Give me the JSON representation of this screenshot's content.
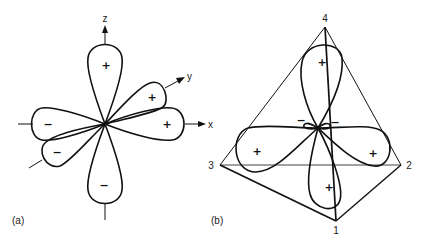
{
  "panel_a": {
    "caption": "(a)",
    "axes": {
      "z": "z",
      "y": "y",
      "x": "x"
    },
    "lobes": [
      {
        "name": "upper-z",
        "sign": "+"
      },
      {
        "name": "lower-z",
        "sign": "−"
      },
      {
        "name": "positive-x",
        "sign": "+"
      },
      {
        "name": "positive-y",
        "sign": "+"
      },
      {
        "name": "negative-x",
        "sign": "−"
      },
      {
        "name": "negative-y",
        "sign": "−"
      }
    ]
  },
  "panel_b": {
    "caption": "(b)",
    "vertices": {
      "top": "4",
      "left": "3",
      "right": "2",
      "front": "1"
    },
    "lobes": [
      {
        "name": "upper",
        "sign": "+"
      },
      {
        "name": "left",
        "sign": "+"
      },
      {
        "name": "right",
        "sign": "+"
      },
      {
        "name": "lower",
        "sign": "+"
      },
      {
        "name": "small-left",
        "sign": "−"
      },
      {
        "name": "small-right",
        "sign": "−"
      }
    ]
  }
}
